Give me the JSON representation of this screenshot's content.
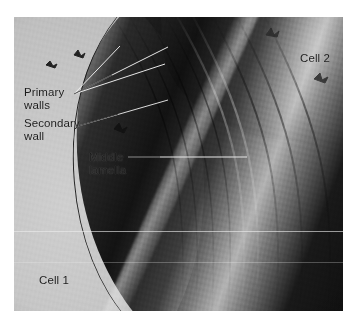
{
  "figure": {
    "kind": "electron-micrograph",
    "plate": {
      "background_color": "#8f8f8f",
      "border_color": "#ffffff"
    }
  },
  "labels": {
    "primary_walls": "Primary\nwalls",
    "secondary_wall": "Secondary\nwall",
    "middle_lamella": "Middle\nlamella",
    "cell_2": "Cell 2",
    "cell_1": "Cell 1"
  },
  "label_colors": {
    "text": "#1b1b1b",
    "leader_line": "#f2f2f2",
    "leader_line_dark": "#1a1a1a"
  },
  "leaders": {
    "primary_walls_a": "from label to upper wall layer",
    "primary_walls_b": "from label to second wall layer",
    "secondary_wall": "from label to secondary wall layer",
    "middle_lamella": "from label horizontally to bright lamella streak"
  },
  "regions": {
    "cell_1_lumen": "pale cytoplasm-free lumen, lower left",
    "cell_2_lumen": "pale lumen, upper right",
    "wall_band": "dark double cell wall sweeping diagonally",
    "middle_lamella_streak": "bright thin pectin-rich layer between primary walls"
  }
}
